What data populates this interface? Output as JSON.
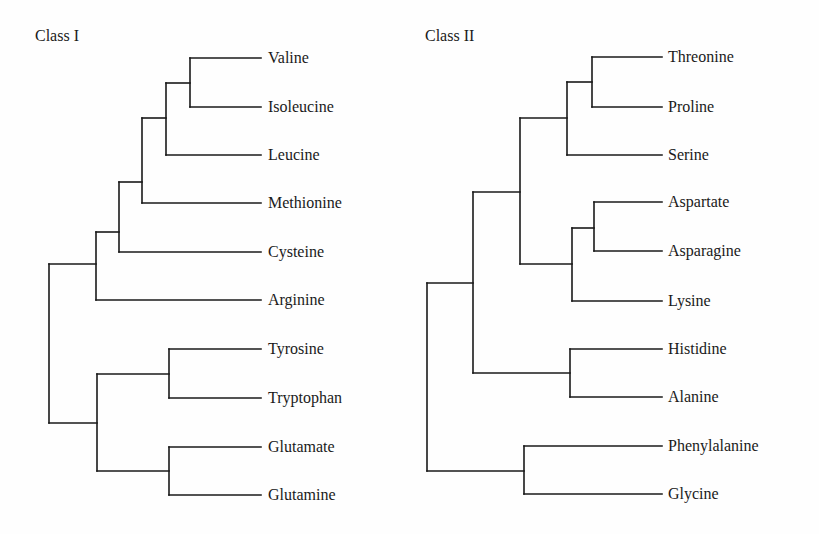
{
  "figure": {
    "background": "#fefefe",
    "line_color": "#1a1a1a"
  },
  "trees": [
    {
      "title": "Class I",
      "title_pos": [
        35,
        41
      ],
      "label_x": 268,
      "leaf_end_x": 261,
      "leaves": [
        {
          "label": "Valine",
          "y": 58
        },
        {
          "label": "Isoleucine",
          "y": 107
        },
        {
          "label": "Leucine",
          "y": 155
        },
        {
          "label": "Methionine",
          "y": 203
        },
        {
          "label": "Cysteine",
          "y": 252
        },
        {
          "label": "Arginine",
          "y": 300
        },
        {
          "label": "Tyrosine",
          "y": 349
        },
        {
          "label": "Tryptophan",
          "y": 398
        },
        {
          "label": "Glutamate",
          "y": 447
        },
        {
          "label": "Glutamine",
          "y": 495
        }
      ],
      "nodes": [
        {
          "x": 190,
          "y_top": 58,
          "y_bottom": 107,
          "attach_y": 83,
          "parent_x": 166
        },
        {
          "x": 166,
          "y_top": 83,
          "y_bottom": 155,
          "attach_y": 118,
          "parent_x": 142
        },
        {
          "x": 142,
          "y_top": 118,
          "y_bottom": 203,
          "attach_y": 182,
          "parent_x": 119
        },
        {
          "x": 119,
          "y_top": 182,
          "y_bottom": 252,
          "attach_y": 232,
          "parent_x": 96
        },
        {
          "x": 96,
          "y_top": 232,
          "y_bottom": 300,
          "attach_y": 264,
          "parent_x": 49
        },
        {
          "x": 169,
          "y_top": 349,
          "y_bottom": 398,
          "attach_y": 374,
          "parent_x": 97
        },
        {
          "x": 169,
          "y_top": 447,
          "y_bottom": 495,
          "attach_y": 471,
          "parent_x": 97
        },
        {
          "x": 97,
          "y_top": 374,
          "y_bottom": 471,
          "attach_y": 423,
          "parent_x": 49
        },
        {
          "x": 49,
          "y_top": 264,
          "y_bottom": 423,
          "attach_y": null,
          "parent_x": null
        }
      ],
      "leaf_stubs": [
        {
          "leaf": "Valine",
          "from_x": 190
        },
        {
          "leaf": "Isoleucine",
          "from_x": 190
        },
        {
          "leaf": "Leucine",
          "from_x": 166
        },
        {
          "leaf": "Methionine",
          "from_x": 142
        },
        {
          "leaf": "Cysteine",
          "from_x": 119
        },
        {
          "leaf": "Arginine",
          "from_x": 96
        },
        {
          "leaf": "Tyrosine",
          "from_x": 169
        },
        {
          "leaf": "Tryptophan",
          "from_x": 169
        },
        {
          "leaf": "Glutamate",
          "from_x": 169
        },
        {
          "leaf": "Glutamine",
          "from_x": 169
        }
      ]
    },
    {
      "title": "Class II",
      "title_pos": [
        425,
        41
      ],
      "label_x": 668,
      "leaf_end_x": 662,
      "leaves": [
        {
          "label": "Threonine",
          "y": 57
        },
        {
          "label": "Proline",
          "y": 107
        },
        {
          "label": "Serine",
          "y": 155
        },
        {
          "label": "Aspartate",
          "y": 202
        },
        {
          "label": "Asparagine",
          "y": 251
        },
        {
          "label": "Lysine",
          "y": 301
        },
        {
          "label": "Histidine",
          "y": 349
        },
        {
          "label": "Alanine",
          "y": 397
        },
        {
          "label": "Phenylalanine",
          "y": 446
        },
        {
          "label": "Glycine",
          "y": 494
        }
      ],
      "nodes": [
        {
          "x": 592,
          "y_top": 57,
          "y_bottom": 107,
          "attach_y": 82,
          "parent_x": 567
        },
        {
          "x": 567,
          "y_top": 82,
          "y_bottom": 155,
          "attach_y": 118,
          "parent_x": 520
        },
        {
          "x": 594,
          "y_top": 202,
          "y_bottom": 251,
          "attach_y": 228,
          "parent_x": 572
        },
        {
          "x": 572,
          "y_top": 228,
          "y_bottom": 301,
          "attach_y": 264,
          "parent_x": 520
        },
        {
          "x": 520,
          "y_top": 118,
          "y_bottom": 264,
          "attach_y": 192,
          "parent_x": 473
        },
        {
          "x": 570,
          "y_top": 349,
          "y_bottom": 397,
          "attach_y": 373,
          "parent_x": 473
        },
        {
          "x": 473,
          "y_top": 192,
          "y_bottom": 373,
          "attach_y": 283,
          "parent_x": 427
        },
        {
          "x": 524,
          "y_top": 446,
          "y_bottom": 494,
          "attach_y": 471,
          "parent_x": 427
        },
        {
          "x": 427,
          "y_top": 283,
          "y_bottom": 471,
          "attach_y": null,
          "parent_x": null
        }
      ],
      "leaf_stubs": [
        {
          "leaf": "Threonine",
          "from_x": 592
        },
        {
          "leaf": "Proline",
          "from_x": 592
        },
        {
          "leaf": "Serine",
          "from_x": 567
        },
        {
          "leaf": "Aspartate",
          "from_x": 594
        },
        {
          "leaf": "Asparagine",
          "from_x": 594
        },
        {
          "leaf": "Lysine",
          "from_x": 572
        },
        {
          "leaf": "Histidine",
          "from_x": 570
        },
        {
          "leaf": "Alanine",
          "from_x": 570
        },
        {
          "leaf": "Phenylalanine",
          "from_x": 524
        },
        {
          "leaf": "Glycine",
          "from_x": 524
        }
      ]
    }
  ]
}
